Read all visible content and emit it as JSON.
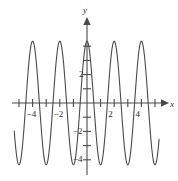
{
  "chart_data": {
    "type": "line",
    "title": "",
    "subtitle": "",
    "xlabel": "x",
    "ylabel": "y",
    "xlim": [
      -5.4,
      5.6
    ],
    "ylim": [
      -5.2,
      5.0
    ],
    "grid": false,
    "legend": null,
    "axis_style": "arrow-ended cartesian axes through origin",
    "x_ticks": [
      -5,
      -4,
      -3,
      -2,
      -1,
      1,
      2,
      3,
      4,
      5
    ],
    "x_tick_labels": [
      {
        "value": -4,
        "text": "−4"
      },
      {
        "value": -2,
        "text": "−2"
      },
      {
        "value": 2,
        "text": "2"
      },
      {
        "value": 4,
        "text": "4"
      }
    ],
    "y_ticks": [
      -4,
      -3,
      -2,
      -1,
      1,
      2,
      3,
      4
    ],
    "y_tick_labels": [
      {
        "value": 2,
        "text": "2"
      },
      {
        "value": -2,
        "text": "−2"
      },
      {
        "value": -4,
        "text": "−4"
      }
    ],
    "series": [
      {
        "name": "curve",
        "color": "#4a4a4a",
        "function": "y = 4.35*cos(pi*x)",
        "amplitude": 4.35,
        "period": 2,
        "phase": 0,
        "peaks_x": [
          -4,
          -2,
          0,
          2,
          4
        ],
        "peaks_y": [
          4.35,
          4.35,
          4.35,
          4.35,
          4.35
        ],
        "troughs_x": [
          -5,
          -3,
          -1,
          1,
          3,
          5
        ],
        "troughs_y": [
          -4.35,
          -4.35,
          -4.35,
          -4.35,
          -4.35
        ],
        "x_start": -5.35,
        "x_end": 5.3
      }
    ]
  },
  "axes": {
    "x_axis_name": "x",
    "y_axis_name": "y"
  }
}
